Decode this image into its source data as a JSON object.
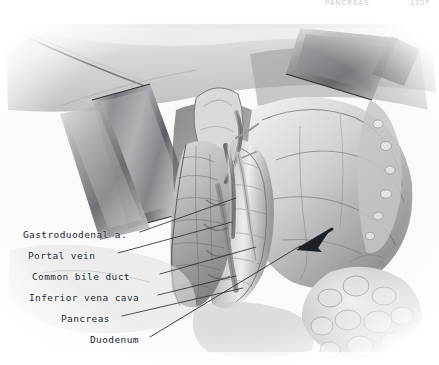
{
  "running_head": {
    "title": "PANCREAS",
    "page_number": "1207"
  },
  "figure": {
    "kind": "anatomical-illustration",
    "arrow_label": "duodenum-arrow",
    "palette": {
      "ink": "#20262c",
      "leader_line": "#2b3238",
      "paper": "#ffffff",
      "plate_base": "#fbfbfb",
      "tissue_mid": "#b9b9b9",
      "tissue_dark": "#4a4a4a",
      "tissue_light": "#e8e8e8",
      "retractor_metal": "#8f9195"
    }
  },
  "labels": [
    {
      "id": "gastroduodenal",
      "text": "Gastroduodenal a.",
      "leader": {
        "x1": 140,
        "y1": 232,
        "x2": 236,
        "y2": 198
      }
    },
    {
      "id": "portal_vein",
      "text": "Portal vein",
      "leader": {
        "x1": 118,
        "y1": 253,
        "x2": 232,
        "y2": 222
      }
    },
    {
      "id": "bile_duct",
      "text": "Common bile duct",
      "leader": {
        "x1": 160,
        "y1": 274,
        "x2": 256,
        "y2": 247
      }
    },
    {
      "id": "vena_cava",
      "text": "Inferior vena cava",
      "leader": {
        "x1": 158,
        "y1": 295,
        "x2": 236,
        "y2": 276
      }
    },
    {
      "id": "pancreas",
      "text": "Pancreas",
      "leader": {
        "x1": 122,
        "y1": 316,
        "x2": 243,
        "y2": 288
      }
    },
    {
      "id": "duodenum",
      "text": "Duodenum",
      "leader": {
        "x1": 150,
        "y1": 337,
        "x2": 330,
        "y2": 232
      }
    }
  ]
}
